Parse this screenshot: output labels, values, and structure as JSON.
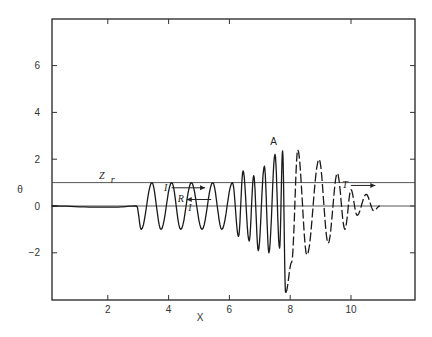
{
  "chart_data": {
    "type": "line",
    "title": "",
    "xlabel": "X",
    "ylabel": "θ",
    "xlim": [
      0.15,
      12
    ],
    "ylim": [
      -4,
      8
    ],
    "grid": false,
    "legend": null,
    "x_ticks": [
      2,
      4,
      6,
      8,
      10
    ],
    "x_tick_labels": [
      "2",
      "4",
      "6",
      "8",
      "10"
    ],
    "y_ticks": [
      -2,
      0,
      2,
      4,
      6
    ],
    "y_tick_labels": [
      "−2",
      "0",
      "2",
      "4",
      "6"
    ],
    "reference_lines": [
      {
        "name": "Z_r",
        "y": 1.0,
        "label": "Z r"
      },
      {
        "name": "zero",
        "y": 0.0,
        "label": ""
      }
    ],
    "annotations": [
      {
        "text": "A",
        "x": 7.45,
        "y": 2.6
      },
      {
        "text": "Z",
        "x": 1.8,
        "y": 1.15,
        "subscript": "r"
      },
      {
        "text": "I",
        "x": 3.9,
        "y": 0.65,
        "arrow": "right",
        "arrow_to_x": 5.2
      },
      {
        "text": "R",
        "x": 4.4,
        "y": 0.15,
        "arrow": "left",
        "arrow_from_x": 5.4
      },
      {
        "text": "I",
        "x": 4.7,
        "y": -0.2
      },
      {
        "text": "T",
        "x": 9.8,
        "y": 0.75,
        "arrow": "right",
        "arrow_to_x": 10.8
      }
    ],
    "series": [
      {
        "name": "solid wave (incident + reflected)",
        "style": "solid",
        "description": "Near-zero ripples from X≈1.2 to 2.5; incident wave of amplitude ≈1 from X≈2.9 to 6.2; superposed shorter-wavelength oscillations growing to ≈2.3 up to X≈7.8",
        "points": [
          {
            "x": 0.15,
            "y": 0.0
          },
          {
            "x": 1.7,
            "y": -0.05
          },
          {
            "x": 2.2,
            "y": -0.05
          },
          {
            "x": 2.95,
            "y": 0.0
          },
          {
            "x": 3.1,
            "y": -1.0
          },
          {
            "x": 3.45,
            "y": 1.0
          },
          {
            "x": 3.75,
            "y": -1.0
          },
          {
            "x": 4.1,
            "y": 1.0
          },
          {
            "x": 4.4,
            "y": -1.0
          },
          {
            "x": 4.75,
            "y": 1.0
          },
          {
            "x": 5.1,
            "y": -1.0
          },
          {
            "x": 5.45,
            "y": 1.0
          },
          {
            "x": 5.75,
            "y": -1.0
          },
          {
            "x": 6.1,
            "y": 1.0
          },
          {
            "x": 6.3,
            "y": -1.3
          },
          {
            "x": 6.45,
            "y": 1.5
          },
          {
            "x": 6.65,
            "y": -1.5
          },
          {
            "x": 6.8,
            "y": 1.3
          },
          {
            "x": 6.95,
            "y": -1.9
          },
          {
            "x": 7.15,
            "y": 1.7
          },
          {
            "x": 7.3,
            "y": -2.0
          },
          {
            "x": 7.5,
            "y": 2.2
          },
          {
            "x": 7.65,
            "y": -1.8
          },
          {
            "x": 7.75,
            "y": 2.35
          },
          {
            "x": 7.85,
            "y": -3.7
          }
        ]
      },
      {
        "name": "dashed wave (transmitted)",
        "style": "dashed",
        "description": "Transmitted wave beyond X≈7.8 with decaying amplitude",
        "points": [
          {
            "x": 7.85,
            "y": -3.7
          },
          {
            "x": 8.05,
            "y": -2.4
          },
          {
            "x": 8.25,
            "y": 2.4
          },
          {
            "x": 8.55,
            "y": -2.1
          },
          {
            "x": 8.95,
            "y": 2.0
          },
          {
            "x": 9.25,
            "y": -1.6
          },
          {
            "x": 9.55,
            "y": 1.4
          },
          {
            "x": 9.8,
            "y": -1.0
          },
          {
            "x": 10.0,
            "y": 0.7
          },
          {
            "x": 10.2,
            "y": -0.4
          },
          {
            "x": 10.5,
            "y": 0.5
          },
          {
            "x": 10.75,
            "y": -0.2
          },
          {
            "x": 10.95,
            "y": 0.0
          }
        ]
      }
    ]
  }
}
